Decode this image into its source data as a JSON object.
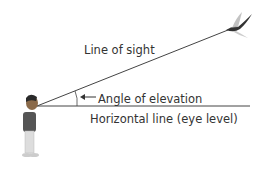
{
  "diagram": {
    "labels": {
      "line_of_sight": "Line of sight",
      "angle_of_elevation": "Angle of elevation",
      "horizontal_line": "Horizontal line (eye level)"
    },
    "figures": [
      "person-observer",
      "flying-bird"
    ],
    "colors": {
      "line": "#444444",
      "text": "#333333"
    }
  }
}
